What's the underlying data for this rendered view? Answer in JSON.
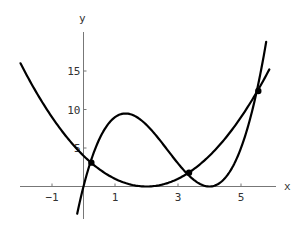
{
  "chart_data": {
    "type": "line",
    "title": "",
    "xlabel": "x",
    "ylabel": "y",
    "xlim": [
      -2.0,
      6.0
    ],
    "ylim": [
      -4.0,
      20.0
    ],
    "grid": false,
    "legend": null,
    "x_ticks": [
      -1,
      1,
      3,
      5
    ],
    "x_tick_labels": [
      "−1",
      "1",
      "3",
      "5"
    ],
    "y_ticks": [
      5,
      10,
      15
    ],
    "y_tick_labels": [
      "5",
      "10",
      "15"
    ],
    "series": [
      {
        "name": "parabola y=(x-2)^2",
        "x": [
          -2.0,
          -1.5,
          -1.0,
          -0.5,
          0.0,
          0.5,
          1.0,
          1.5,
          2.0,
          2.5,
          3.0,
          3.5,
          4.0,
          4.5,
          5.0,
          5.5,
          5.9
        ],
        "y": [
          16.0,
          12.25,
          9.0,
          6.25,
          4.0,
          2.25,
          1.0,
          0.25,
          0.0,
          0.25,
          1.0,
          2.25,
          4.0,
          6.25,
          9.0,
          12.25,
          15.2
        ]
      },
      {
        "name": "cubic y=x(x-4)^2",
        "x": [
          -0.2,
          0.0,
          0.25,
          0.5,
          1.0,
          1.33,
          1.5,
          2.0,
          2.5,
          3.0,
          3.5,
          4.0,
          4.5,
          5.0,
          5.5,
          5.8
        ],
        "y": [
          -3.53,
          0.0,
          3.52,
          6.13,
          9.0,
          9.48,
          9.38,
          8.0,
          5.63,
          3.0,
          0.88,
          0.0,
          1.13,
          5.0,
          12.38,
          18.79
        ]
      }
    ],
    "intersection_points": [
      {
        "x": 0.25,
        "y": 3.1
      },
      {
        "x": 3.35,
        "y": 1.8
      },
      {
        "x": 5.55,
        "y": 12.4
      }
    ]
  },
  "axes": {
    "x_label": "x",
    "y_label": "y"
  }
}
